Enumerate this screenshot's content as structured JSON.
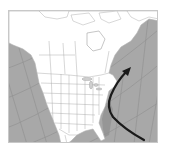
{
  "map": {
    "region": "North America",
    "projection": "conic (curved graticule)",
    "colors": {
      "ocean": "#a8a8a8",
      "land": "#ffffff",
      "borders": "#9a9a9a",
      "graticule": "#8e8e8e",
      "track": "#1a1a1a",
      "shelf": "#8f8f8f"
    },
    "features": [
      {
        "name": "storm-track-arrow",
        "description": "Curved arrow from off Florida/Bahamas northward along the U.S. East Coast toward Nova Scotia"
      }
    ]
  }
}
